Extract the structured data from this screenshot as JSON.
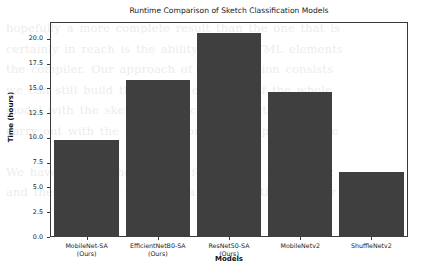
{
  "chart_data": {
    "type": "bar",
    "title": "Runtime Comparison of Sketch Classification Models",
    "xlabel": "Models",
    "ylabel": "Time (hours)",
    "categories": [
      "MobileNet-SA\n(Ours)",
      "EfficientNetB0-SA\n(Ours)",
      "ResNet50-SA\n(Ours)",
      "MobileNetv2",
      "ShuffleNetv2"
    ],
    "category_lines": [
      [
        "MobileNet-SA",
        "(Ours)"
      ],
      [
        "EfficientNetB0-SA",
        "(Ours)"
      ],
      [
        "ResNet50-SA",
        "(Ours)"
      ],
      [
        "MobileNetv2",
        ""
      ],
      [
        "ShuffleNetv2",
        ""
      ]
    ],
    "values": [
      9.75,
      15.85,
      20.55,
      14.6,
      6.55
    ],
    "ylim": [
      0.0,
      21.6
    ],
    "yticks": [
      0.0,
      2.5,
      5.0,
      7.5,
      10.0,
      12.5,
      15.0,
      17.5,
      20.0
    ],
    "ytick_labels": [
      "0.0",
      "2.5",
      "5.0",
      "7.5",
      "10.0",
      "12.5",
      "15.0",
      "17.5",
      "20.0"
    ],
    "grid": false,
    "legend": false,
    "bar_color": "#3f3f3f",
    "axes_color": "#3a3a3a",
    "background": "#ffffff"
  },
  "background_page_text": "hopefully a more complete result than the one that is\ncertainly in reach is the ability of the HTML elements\nthe compiler. Our approach of the definition consists\nwe can still build the models efficiency of the whole\nmodel with the sketch classification results reported\ncarry out with the sketch amount of the page sample\n\nWe have trained the network for runtime benchmark\nand the remaining values on a single GPU device for"
}
